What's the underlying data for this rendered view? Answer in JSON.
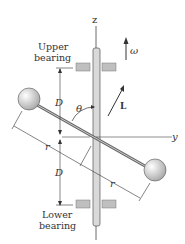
{
  "diagram": {
    "axes": {
      "z": "z",
      "y": "y"
    },
    "labels": {
      "upper_bearing_line1": "Upper",
      "upper_bearing_line2": "bearing",
      "lower_bearing_line1": "Lower",
      "lower_bearing_line2": "bearing",
      "D_upper": "D",
      "D_lower": "D",
      "r_left": "r",
      "r_right": "r",
      "theta": "θ",
      "omega": "ω",
      "L": "L"
    },
    "colors": {
      "shaft": "#d9d9d9",
      "bearing": "#bfbfbf",
      "sphere": "#dcdcdc",
      "line": "#333333"
    }
  }
}
